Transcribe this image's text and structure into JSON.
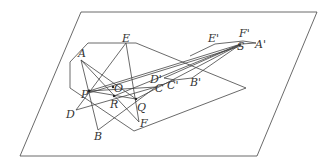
{
  "diagram": {
    "type": "geometry-projection",
    "plane": [
      [
        81,
        12
      ],
      [
        317,
        12
      ],
      [
        257,
        156
      ],
      [
        20,
        156
      ]
    ],
    "region": [
      [
        88,
        43
      ],
      [
        136,
        43
      ],
      [
        246,
        88
      ],
      [
        134,
        131
      ],
      [
        70,
        88
      ],
      [
        70,
        62
      ]
    ],
    "points": {
      "A": [
        81,
        60
      ],
      "B": [
        98,
        130
      ],
      "C": [
        156,
        87
      ],
      "D": [
        76,
        110
      ],
      "E": [
        126,
        43
      ],
      "F": [
        139,
        122
      ],
      "P": [
        89,
        91
      ],
      "O": [
        113,
        87
      ],
      "R": [
        114,
        96
      ],
      "Q": [
        136,
        99
      ],
      "S": [
        241,
        44
      ],
      "A'": [
        256,
        43
      ],
      "B'": [
        192,
        78
      ],
      "C'": [
        175,
        80
      ],
      "D'": [
        164,
        78
      ],
      "E'": [
        215,
        44
      ],
      "F'": [
        243,
        41
      ]
    },
    "labels": [
      {
        "text": "A",
        "x": 78,
        "y": 57
      },
      {
        "text": "E",
        "x": 122,
        "y": 42
      },
      {
        "text": "P",
        "x": 81,
        "y": 98
      },
      {
        "text": "O",
        "x": 114,
        "y": 92
      },
      {
        "text": "R",
        "x": 110,
        "y": 108
      },
      {
        "text": "Q",
        "x": 137,
        "y": 111
      },
      {
        "text": "C",
        "x": 155,
        "y": 92
      },
      {
        "text": "D'",
        "x": 150,
        "y": 83
      },
      {
        "text": "C'",
        "x": 167,
        "y": 89
      },
      {
        "text": "B'",
        "x": 190,
        "y": 86
      },
      {
        "text": "D",
        "x": 66,
        "y": 118
      },
      {
        "text": "B",
        "x": 94,
        "y": 140
      },
      {
        "text": "F",
        "x": 140,
        "y": 127
      },
      {
        "text": "S",
        "x": 237,
        "y": 50
      },
      {
        "text": "A'",
        "x": 255,
        "y": 48
      },
      {
        "text": "E'",
        "x": 208,
        "y": 42
      },
      {
        "text": "F'",
        "x": 239,
        "y": 37
      }
    ]
  }
}
